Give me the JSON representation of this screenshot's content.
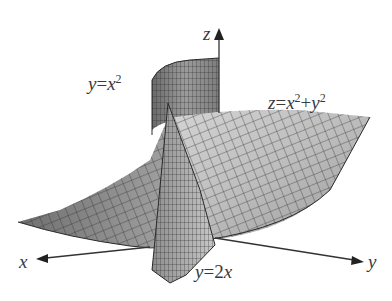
{
  "diagram": {
    "title": "",
    "axes": {
      "x_label": "x",
      "y_label": "y",
      "z_label": "z"
    },
    "surfaces": [
      {
        "name": "paraboloid",
        "label_lhs": "z",
        "label_eq": "=",
        "label_t1": "x",
        "label_t1_exp": "2",
        "label_plus": "+",
        "label_t2": "y",
        "label_t2_exp": "2"
      },
      {
        "name": "parabolic-cylinder",
        "label_lhs": "y",
        "label_eq": "=",
        "label_t1": "x",
        "label_t1_exp": "2"
      },
      {
        "name": "plane",
        "label_lhs": "y",
        "label_eq": "=",
        "label_coef": "2",
        "label_var": "x"
      }
    ],
    "colors": {
      "surface_fill": "#b8b8b8",
      "surface_dark": "#7a7a7a",
      "mesh_line": "#2a2a2a",
      "axis": "#333333",
      "text": "#3a3a3a",
      "background": "#ffffff"
    }
  }
}
